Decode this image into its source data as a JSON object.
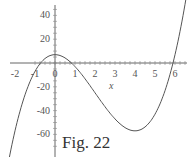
{
  "caption": "Fig. 22",
  "chart_data": {
    "type": "line",
    "title": "",
    "xlabel": "x",
    "ylabel": "",
    "function": "f(x) = 2x^3 - 12x^2 + 7",
    "x_ticks": [
      -2,
      -1,
      0,
      1,
      2,
      3,
      4,
      5,
      6
    ],
    "y_ticks": [
      40,
      20,
      -20,
      -40,
      -60
    ],
    "xlim": [
      -2.3,
      6.6
    ],
    "ylim": [
      -72,
      50
    ],
    "grid": false,
    "series": [
      {
        "name": "f(x)",
        "x": [
          -2,
          -1,
          -0.77,
          0,
          0.8,
          2,
          3,
          4,
          5,
          6,
          6.6
        ],
        "y": [
          -57,
          -7,
          0,
          7,
          0,
          -25,
          -47,
          -57,
          -43,
          7,
          57
        ]
      }
    ],
    "color": "#555555"
  }
}
